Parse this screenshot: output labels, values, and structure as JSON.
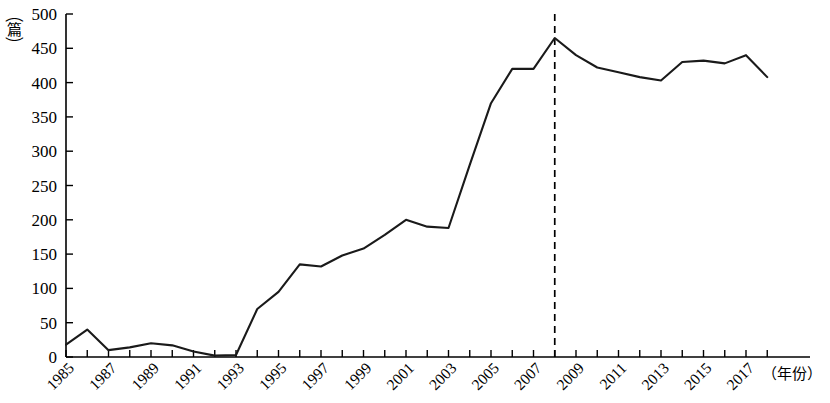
{
  "chart_data": {
    "type": "line",
    "title": "",
    "xlabel": "（年份）",
    "ylabel": "（篇）",
    "ylim": [
      0,
      500
    ],
    "xlim": [
      1985,
      2018
    ],
    "grid": false,
    "legend": null,
    "y_ticks": [
      0,
      50,
      100,
      150,
      200,
      250,
      300,
      350,
      400,
      450,
      500
    ],
    "x_ticks": [
      1985,
      1987,
      1989,
      1991,
      1993,
      1995,
      1997,
      1999,
      2001,
      2003,
      2005,
      2007,
      2009,
      2011,
      2013,
      2015,
      2017
    ],
    "x_tick_labels": [
      "1985",
      "1987",
      "1989",
      "1991",
      "1993",
      "1995",
      "1997",
      "1999",
      "2001",
      "2003",
      "2005",
      "2007",
      "2009",
      "2011",
      "2013",
      "2015",
      "2017"
    ],
    "x_all_years": [
      1985,
      1986,
      1987,
      1988,
      1989,
      1990,
      1991,
      1992,
      1993,
      1994,
      1995,
      1996,
      1997,
      1998,
      1999,
      2000,
      2001,
      2002,
      2003,
      2004,
      2005,
      2006,
      2007,
      2008,
      2009,
      2010,
      2011,
      2012,
      2013,
      2014,
      2015,
      2016,
      2017,
      2018
    ],
    "series": [
      {
        "name": "篇数",
        "color": "#1a1a1a",
        "values": [
          18,
          40,
          10,
          14,
          20,
          17,
          8,
          2,
          3,
          70,
          95,
          135,
          132,
          148,
          158,
          178,
          200,
          190,
          188,
          280,
          370,
          420,
          420,
          465,
          440,
          422,
          415,
          408,
          403,
          430,
          432,
          428,
          440,
          408
        ]
      }
    ],
    "annotations": [
      {
        "type": "vertical-dashed-line",
        "name": "year-2008-marker",
        "x": 2008,
        "label": ""
      }
    ]
  },
  "axes": {
    "y_axis_unit_label": "（篇）",
    "y_axis_unit_chars": [
      "（",
      "篇",
      "）"
    ],
    "x_axis_unit_label": "（年份）"
  }
}
